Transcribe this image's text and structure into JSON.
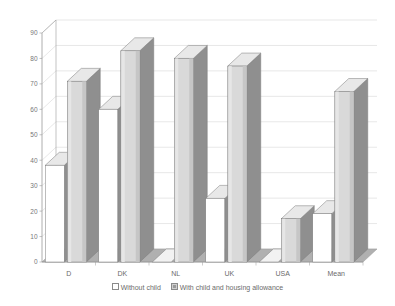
{
  "chart_data": {
    "type": "bar",
    "title": "",
    "subtitle": "",
    "xlabel": "",
    "ylabel": "",
    "ylim": [
      0,
      90
    ],
    "yticks": [
      0,
      10,
      20,
      30,
      40,
      50,
      60,
      70,
      80,
      90
    ],
    "grid": true,
    "legend_position": "bottom",
    "style": "3d-columns-grayscale",
    "categories": [
      "D",
      "DK",
      "NL",
      "UK",
      "USA",
      "Mean"
    ],
    "series": [
      {
        "name": "Without child",
        "swatch": "sw-empty",
        "values": [
          38,
          60,
          0,
          25,
          0,
          19
        ]
      },
      {
        "name": "With child and housing allowance",
        "swatch": "sw-filled",
        "values": [
          71,
          83,
          80,
          77,
          17,
          67
        ]
      }
    ]
  },
  "legend": {
    "items": [
      {
        "label": "Without child",
        "swatch": "sw-empty"
      },
      {
        "label": "With child and housing allowance",
        "swatch": "sw-filled"
      }
    ]
  },
  "colors": {
    "bar_front_series1": "#ffffff",
    "bar_front_series2": "#d9d9d9",
    "bar_side": "#8f8f8f",
    "bar_top": "#e8e8e8",
    "bar_outline": "#7a7a7a",
    "floor": "#b0b0b0",
    "grid": "#d7d7d7",
    "axis": "#9a9a9a",
    "text": "#6b6b6b",
    "background": "#ffffff"
  }
}
